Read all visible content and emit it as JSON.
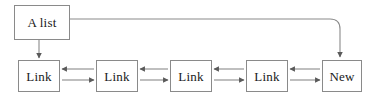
{
  "diagram": {
    "type": "doubly-linked-list",
    "canvas": {
      "width": 372,
      "height": 99,
      "background": "#ffffff"
    },
    "style": {
      "box_border_color": "#8a8a8a",
      "box_fill_color": "#ffffff",
      "line_color": "#8a8a8a",
      "text_color": "#1a1a1a"
    },
    "head_node": {
      "label": "A list",
      "x": 14,
      "y": 5,
      "width": 56,
      "height": 35
    },
    "nodes": [
      {
        "label": "Link",
        "x": 18,
        "y": 60,
        "width": 42,
        "height": 32
      },
      {
        "label": "Link",
        "x": 96,
        "y": 60,
        "width": 42,
        "height": 32
      },
      {
        "label": "Link",
        "x": 170,
        "y": 60,
        "width": 42,
        "height": 32
      },
      {
        "label": "Link",
        "x": 246,
        "y": 60,
        "width": 42,
        "height": 32
      },
      {
        "label": "New",
        "x": 322,
        "y": 60,
        "width": 40,
        "height": 32
      }
    ],
    "connections": [
      {
        "name": "head-to-first",
        "from": "A list",
        "to": "Link",
        "direction": "down",
        "arrow": "single"
      },
      {
        "name": "head-to-new",
        "from": "A list",
        "to": "New",
        "direction": "right-then-down",
        "arrow": "single"
      },
      {
        "name": "link1-link2",
        "from": "Link",
        "to": "Link",
        "direction": "horizontal",
        "arrow": "double"
      },
      {
        "name": "link2-link3",
        "from": "Link",
        "to": "Link",
        "direction": "horizontal",
        "arrow": "double"
      },
      {
        "name": "link3-link4",
        "from": "Link",
        "to": "Link",
        "direction": "horizontal",
        "arrow": "double"
      },
      {
        "name": "link4-new",
        "from": "Link",
        "to": "New",
        "direction": "horizontal",
        "arrow": "double"
      }
    ]
  }
}
